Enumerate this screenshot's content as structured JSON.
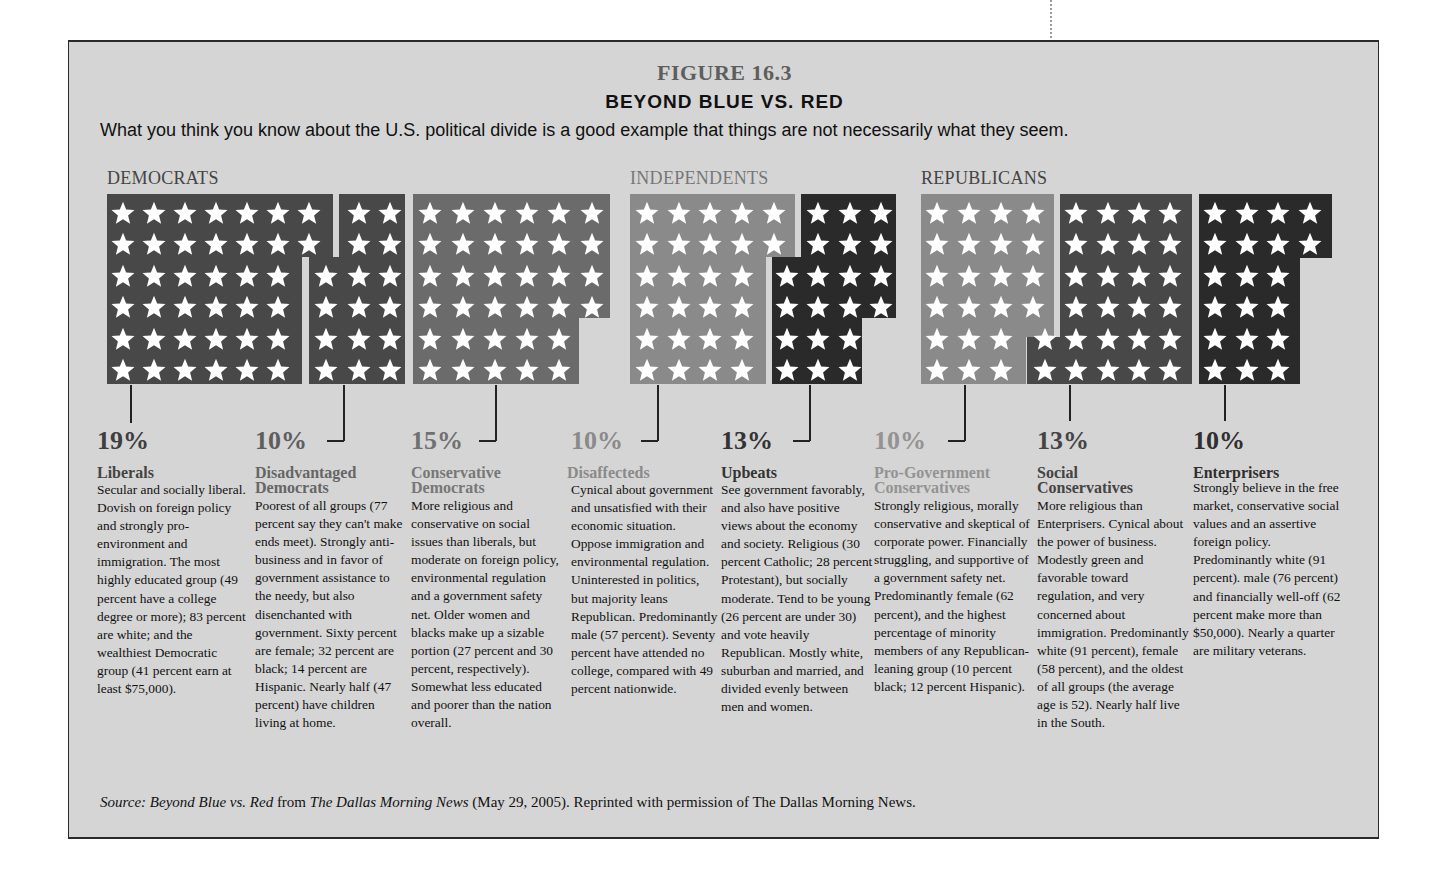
{
  "figure": {
    "number": "FIGURE 16.3",
    "title": "BEYOND BLUE VS. RED",
    "subtitle": "What you think you know about the U.S. political divide is a good example that things are not necessarily what they seem.",
    "source": {
      "label": "Source:",
      "work": "Beyond Blue vs. Red",
      "from": "from",
      "publication": "The Dallas Morning News",
      "rest": "(May 29, 2005). Reprinted with permission of The Dallas Morning News."
    }
  },
  "parties": [
    {
      "name": "DEMOCRATS"
    },
    {
      "name": "INDEPENDENTS"
    },
    {
      "name": "REPUBLICANS"
    }
  ],
  "colors": {
    "background": "#d5d5d5",
    "dark_block": "#484848",
    "mid_block": "#6b6b6b",
    "light_block": "#8a8a8a",
    "darkest_block": "#2a2a2a",
    "star": "#ffffff",
    "text_dark": "#3a3a3a",
    "text_mid": "#6a6a6a",
    "text_light": "#8f8f8f"
  },
  "groups": [
    {
      "percent": "19%",
      "name_line1": "Liberals",
      "name_line2": "",
      "party": "Democrats",
      "stars": 19,
      "description": "Secular and socially liberal. Dovish on foreign policy and strongly pro-environment and immigration. The most highly educated group (49 percent have a college degree or more); 83 percent are white; and the wealthiest Democratic group (41 percent earn at least $75,000)."
    },
    {
      "percent": "10%",
      "name_line1": "Disadvantaged",
      "name_line2": "Democrats",
      "party": "Democrats",
      "stars": 10,
      "description": "Poorest of all groups (77 percent say they can't make ends meet). Strongly anti-business and in favor of government assistance to the needy, but also disenchanted with government. Sixty percent are female; 32 percent are black; 14 percent are Hispanic. Nearly half (47 percent) have children living at home."
    },
    {
      "percent": "15%",
      "name_line1": "Conservative",
      "name_line2": "Democrats",
      "party": "Democrats",
      "stars": 15,
      "description": "More religious and conservative on social issues than liberals, but moderate on foreign policy, environmental regulation and a government safety net. Older women and blacks make up a sizable portion (27 percent and 30 percent, respectively). Somewhat less educated and poorer than the nation overall."
    },
    {
      "percent": "10%",
      "name_line1": "Disaffecteds",
      "name_line2": "",
      "party": "Independents",
      "stars": 10,
      "description": "Cynical about government and unsatisfied with their economic situation. Oppose immigration and environmental regulation. Uninterested in politics, but majority leans Republican. Predominantly male (57 percent). Seventy percent have attended no college, compared with 49 percent nationwide."
    },
    {
      "percent": "13%",
      "name_line1": "Upbeats",
      "name_line2": "",
      "party": "Independents",
      "stars": 13,
      "description": "See government favorably, and also have positive views about the economy and society. Religious (30 percent Catholic; 28 percent Protestant), but socially moderate. Tend to be young (26 percent are under 30) and vote heavily Republican. Mostly white, suburban and married, and divided evenly between men and women."
    },
    {
      "percent": "10%",
      "name_line1": "Pro-Government",
      "name_line2": "Conservatives",
      "party": "Republicans",
      "stars": 10,
      "description": "Strongly religious, morally conservative and skeptical of corporate power. Financially struggling, and supportive of a government safety net. Predominantly female (62 percent), and the highest percentage of minority members of any Republican-leaning group (10 percent black; 12 percent Hispanic)."
    },
    {
      "percent": "13%",
      "name_line1": "Social",
      "name_line2": "Conservatives",
      "party": "Republicans",
      "stars": 13,
      "description": "More religious than Enterprisers. Cynical about the power of business. Modestly green and favorable toward regulation, and very concerned about immigration. Predominantly white (91 percent), female (58 percent), and the oldest of all groups (the average age is 52). Nearly half live in the South."
    },
    {
      "percent": "10%",
      "name_line1": "Enterprisers",
      "name_line2": "",
      "party": "Republicans",
      "stars": 10,
      "description": "Strongly believe in the free market, conservative social values and an assertive foreign policy. Predominantly white (91 percent). male (76 percent) and financially well-off (62 percent make more than $50,000). Nearly a quarter are military veterans."
    }
  ],
  "chart_data": {
    "type": "bar",
    "title": "FIGURE 16.3 BEYOND BLUE VS. RED",
    "subtitle": "What you think you know about the U.S. political divide is a good example that things are not necessarily what they seem.",
    "categories": [
      "Liberals",
      "Disadvantaged Democrats",
      "Conservative Democrats",
      "Disaffecteds",
      "Upbeats",
      "Pro-Government Conservatives",
      "Social Conservatives",
      "Enterprisers"
    ],
    "values": [
      19,
      10,
      15,
      10,
      13,
      10,
      13,
      10
    ],
    "unit": "percent",
    "groups": {
      "DEMOCRATS": [
        "Liberals",
        "Disadvantaged Democrats",
        "Conservative Democrats"
      ],
      "INDEPENDENTS": [
        "Disaffecteds",
        "Upbeats"
      ],
      "REPUBLICANS": [
        "Pro-Government Conservatives",
        "Social Conservatives",
        "Enterprisers"
      ]
    },
    "encoding": "pictograph: one star per percentage point in a 6-row grid",
    "xlabel": "",
    "ylabel": "",
    "legend_position": "none",
    "grid": false
  }
}
